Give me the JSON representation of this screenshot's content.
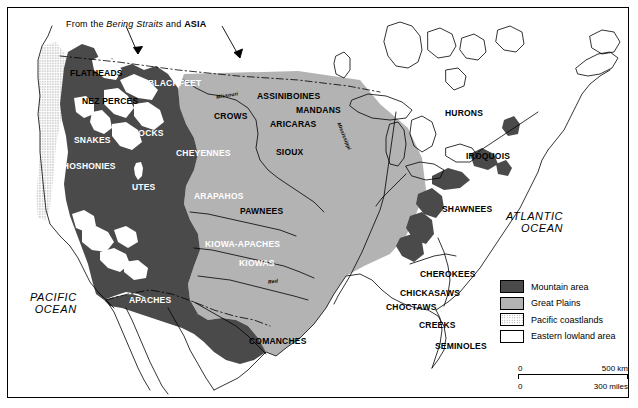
{
  "figure": {
    "annotation": {
      "prefix": "From the ",
      "italic": "Bering Straits",
      "middle": " and ",
      "bold": "ASIA"
    }
  },
  "oceans": [
    {
      "name": "atlantic-ocean",
      "line1": "ATLANTIC",
      "line2": "OCEAN"
    },
    {
      "name": "pacific-ocean",
      "line1": "PACIFIC",
      "line2": "OCEAN"
    }
  ],
  "rivers": [
    {
      "name": "missouri-river",
      "label": "Missouri"
    },
    {
      "name": "mississippi-river",
      "label": "Mississippi"
    },
    {
      "name": "red-river",
      "label": "Red"
    }
  ],
  "tribes": [
    {
      "label": "FLATHEADS",
      "x": 62,
      "y": 60,
      "tone": "onlight"
    },
    {
      "label": "NEZ PERCES",
      "x": 74,
      "y": 88,
      "tone": "onlight"
    },
    {
      "label": "BLACKFEET",
      "x": 140,
      "y": 70,
      "tone": "ondark"
    },
    {
      "label": "ASSINIBOINES",
      "x": 249,
      "y": 83,
      "tone": "onlight"
    },
    {
      "label": "MANDANS",
      "x": 288,
      "y": 97,
      "tone": "onlight"
    },
    {
      "label": "CROWS",
      "x": 206,
      "y": 103,
      "tone": "onlight"
    },
    {
      "label": "ARICARAS",
      "x": 262,
      "y": 111,
      "tone": "onlight"
    },
    {
      "label": "SNAKES",
      "x": 66,
      "y": 127,
      "tone": "ondark"
    },
    {
      "label": "BANNOCKS",
      "x": 105,
      "y": 120,
      "tone": "ondark"
    },
    {
      "label": "CHEYENNES",
      "x": 168,
      "y": 140,
      "tone": "ondark"
    },
    {
      "label": "SIOUX",
      "x": 268,
      "y": 139,
      "tone": "onlight"
    },
    {
      "label": "SHOSHONIES",
      "x": 49,
      "y": 153,
      "tone": "ondark"
    },
    {
      "label": "UTES",
      "x": 124,
      "y": 174,
      "tone": "ondark"
    },
    {
      "label": "ARAPAHOS",
      "x": 186,
      "y": 183,
      "tone": "ondark"
    },
    {
      "label": "PAWNEES",
      "x": 232,
      "y": 198,
      "tone": "onlight"
    },
    {
      "label": "KIOWA-APACHES",
      "x": 197,
      "y": 231,
      "tone": "ondark"
    },
    {
      "label": "KIOWAS",
      "x": 231,
      "y": 250,
      "tone": "ondark"
    },
    {
      "label": "APACHES",
      "x": 121,
      "y": 287,
      "tone": "ondark"
    },
    {
      "label": "COMANCHES",
      "x": 241,
      "y": 328,
      "tone": "onlight"
    },
    {
      "label": "HURONS",
      "x": 437,
      "y": 100,
      "tone": "onlight"
    },
    {
      "label": "IROQUOIS",
      "x": 458,
      "y": 143,
      "tone": "onlight"
    },
    {
      "label": "SHAWNEES",
      "x": 434,
      "y": 196,
      "tone": "onlight"
    },
    {
      "label": "CHEROKEES",
      "x": 412,
      "y": 261,
      "tone": "onlight"
    },
    {
      "label": "CHICKASAWS",
      "x": 392,
      "y": 280,
      "tone": "onlight"
    },
    {
      "label": "CHOCTAWS",
      "x": 378,
      "y": 294,
      "tone": "onlight"
    },
    {
      "label": "CREEKS",
      "x": 411,
      "y": 312,
      "tone": "onlight"
    },
    {
      "label": "SEMINOLES",
      "x": 427,
      "y": 333,
      "tone": "onlight"
    }
  ],
  "legend": {
    "items": [
      {
        "name": "mountain-area",
        "label": "Mountain area",
        "swatch": "sw-mountain",
        "color": "#4a4a4a"
      },
      {
        "name": "great-plains",
        "label": "Great Plains",
        "swatch": "sw-plains",
        "color": "#b3b3b3"
      },
      {
        "name": "pacific-coastlands",
        "label": "Pacific coastlands",
        "swatch": "sw-coast",
        "color": "#ffffff"
      },
      {
        "name": "eastern-lowland-area",
        "label": "Eastern lowland area",
        "swatch": "sw-lowland",
        "color": "#ffffff"
      }
    ]
  },
  "scale": {
    "km": {
      "zero": "0",
      "max": "500 km"
    },
    "miles": {
      "zero": "0",
      "max": "300 miles"
    }
  }
}
